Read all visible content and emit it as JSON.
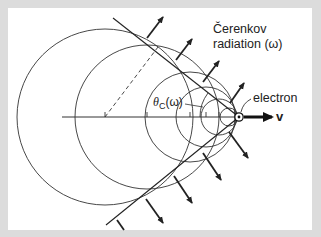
{
  "figure": {
    "title_line1": "Čerenkov",
    "title_line2": "radiation (ω)",
    "electron_label": "electron",
    "angle_label": "θ",
    "angle_subscript": "C",
    "angle_arg": "(ω)",
    "velocity_label": "v"
  },
  "geometry": {
    "electron": {
      "x": 239,
      "y": 117
    },
    "axis": {
      "x_start": 62,
      "y": 117
    },
    "circles": [
      {
        "cx": 105,
        "cy": 117,
        "r": 88
      },
      {
        "cx": 147,
        "cy": 117,
        "r": 72
      },
      {
        "cx": 190,
        "cy": 117,
        "r": 45
      },
      {
        "cx": 206,
        "cy": 117,
        "r": 30
      },
      {
        "cx": 219,
        "cy": 117,
        "r": 18
      },
      {
        "cx": 229,
        "cy": 117,
        "r": 9
      }
    ],
    "cone_upper_end": {
      "x": 113,
      "y": 18
    },
    "cone_lower_end": {
      "x": 106,
      "y": 225
    }
  },
  "colors": {
    "background": "#dcdcdc",
    "panel": "#ffffff",
    "ink": "#222222"
  }
}
